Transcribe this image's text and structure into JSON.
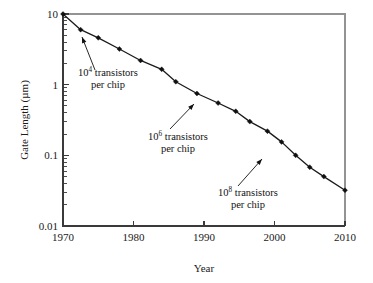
{
  "chart_data": {
    "type": "line",
    "title": "",
    "xlabel": "Year",
    "ylabel": "Gate Length (µm)",
    "xlim": [
      1970,
      2010
    ],
    "ylim": [
      0.01,
      10
    ],
    "yscale": "log",
    "xscale": "linear",
    "grid": false,
    "legend": "none",
    "xticks": [
      1970,
      1980,
      1990,
      2000,
      2010
    ],
    "xtick_labels": [
      "1970",
      "1980",
      "1990",
      "2000",
      "2010"
    ],
    "yticks": [
      10,
      1,
      0.1,
      0.01
    ],
    "ytick_labels": [
      "10",
      "1",
      "0.1",
      "0.01"
    ],
    "series": [
      {
        "name": "Gate length",
        "marker": "diamond",
        "color": "#111111",
        "x": [
          1970,
          1972.5,
          1975,
          1978,
          1981,
          1984,
          1986,
          1989,
          1992,
          1994.5,
          1996.5,
          1999,
          2001,
          2003,
          2005,
          2007,
          2010
        ],
        "y": [
          10.0,
          6.0,
          4.6,
          3.2,
          2.2,
          1.65,
          1.1,
          0.75,
          0.55,
          0.42,
          0.3,
          0.22,
          0.155,
          0.1,
          0.068,
          0.05,
          0.032
        ]
      }
    ],
    "annotations": [
      {
        "id": "annot-1e4",
        "line1_prefix": "10",
        "line1_sup": "4",
        "line1_suffix": " transistors",
        "line2": "per chip",
        "text_x": 78,
        "text_y": 76,
        "leader_from": [
          95,
          70
        ],
        "leader_to": [
          82,
          37
        ],
        "target_point_year": 1972.5
      },
      {
        "id": "annot-1e6",
        "line1_prefix": "10",
        "line1_sup": "6",
        "line1_suffix": " transistors",
        "line2": "per chip",
        "text_x": 148,
        "text_y": 140,
        "leader_from": [
          170,
          129
        ],
        "leader_to": [
          194,
          104
        ],
        "target_point_year": 1989
      },
      {
        "id": "annot-1e8",
        "line1_prefix": "10",
        "line1_sup": "8",
        "line1_suffix": " transistors",
        "line2": "per chip",
        "text_x": 218,
        "text_y": 196,
        "leader_from": [
          238,
          186
        ],
        "leader_to": [
          262,
          159
        ],
        "target_point_year": 2001
      }
    ],
    "geometry": {
      "plot_left": 63,
      "plot_right": 345,
      "plot_top": 14,
      "plot_bottom": 226,
      "decade_px": 70.6,
      "year_px": 7.05
    },
    "colors": {
      "axis": "#3a3a3a",
      "data": "#111111",
      "background": "#ffffff"
    }
  }
}
